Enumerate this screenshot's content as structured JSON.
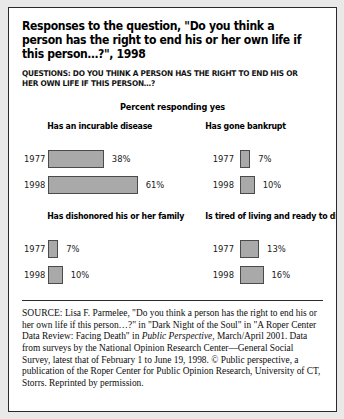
{
  "figure": {
    "title": "Responses to the question, \"Do you think a person has the right to end his or her own life if this person…?\", 1998",
    "subtitle": "QUESTIONS: DO YOU THINK A PERSON HAS THE RIGHT TO END HIS OR HER OWN LIFE IF THIS PERSON…?",
    "axis_label": "Percent responding yes"
  },
  "chart_data": {
    "type": "bar",
    "title": "Responses to the question, \"Do you think a person has the right to end his or her own life if this person…?\", 1998",
    "ylabel": "Percent responding yes",
    "xlabel": "",
    "categories": [
      "1977",
      "1998"
    ],
    "xlim": [
      0,
      61
    ],
    "grid": false,
    "legend": "none",
    "units": "percent",
    "panels": [
      {
        "title": "Has an incurable disease",
        "values": [
          38,
          61
        ],
        "labels": [
          "38%",
          "61%"
        ]
      },
      {
        "title": "Has gone bankrupt",
        "values": [
          7,
          10
        ],
        "labels": [
          "7%",
          "10%"
        ]
      },
      {
        "title": "Has dishonored his or her family",
        "values": [
          7,
          10
        ],
        "labels": [
          "7%",
          "10%"
        ]
      },
      {
        "title": "Is tired of living and ready to die",
        "values": [
          13,
          16
        ],
        "labels": [
          "13%",
          "16%"
        ]
      }
    ],
    "colors": {
      "bar_fill": "#a9a9a9",
      "bar_border": "#4a4a4a",
      "text": "#000000",
      "frame": "#2b2b2b"
    }
  },
  "source": {
    "label": "SOURCE:",
    "text_1": " Lisa F. Parmelee, \"Do you think a person has the right to end his or her own life if this person…?\" in \"Dark Night of the Soul\" in \"A Roper Center Data Review: Facing Death\" in ",
    "italic_1": "Public Perspective,",
    "text_2": " March/April 2001. Data from surveys by the National Opinion Research Center—General Social Survey, latest that of February 1 to June 19, 1998. © Public perspective, a publication of the Roper Center for Public Opinion Research, University of CT, Storrs. Reprinted by permission."
  }
}
